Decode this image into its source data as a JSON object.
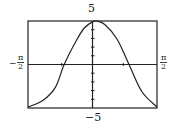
{
  "chart_data": {
    "type": "line",
    "title": "",
    "xlabel": "",
    "ylabel": "",
    "xlim": [
      "-π/2",
      "π/2"
    ],
    "ylim": [
      -5,
      5
    ],
    "x_tick_labels": {
      "left": {
        "sign": "−",
        "num": "π",
        "den": "2"
      },
      "right": {
        "num": "π",
        "den": "2"
      }
    },
    "y_tick_labels": {
      "top": "5",
      "bottom": "−5"
    },
    "grid": false,
    "series": [
      {
        "name": "curve",
        "x": [
          -1.5708,
          -1.2,
          -0.9,
          -0.69,
          -0.4,
          -0.2,
          0,
          0.1,
          0.3,
          0.6,
          0.89,
          1.2,
          1.5708
        ],
        "y": [
          -4.9,
          -4.1,
          -2.6,
          0,
          2.7,
          4.2,
          4.9,
          5.0,
          4.6,
          2.9,
          0,
          -3.1,
          -4.9
        ]
      }
    ],
    "colors": {
      "curve": "#222222",
      "axes": "#222222",
      "frame": "#333333"
    }
  }
}
